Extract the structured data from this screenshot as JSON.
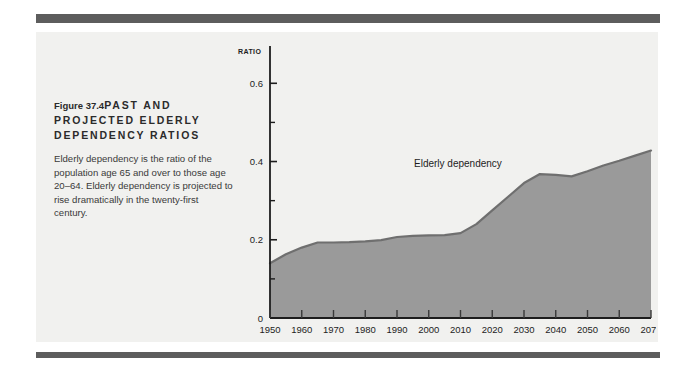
{
  "figure": {
    "number": "Figure 37.4",
    "title": "PAST AND PROJECTED ELDERLY DEPENDENCY RATIOS",
    "body": "Elderly dependency is the ratio of the population age 65 and over to those age 20–64. Elderly dependency is projected to rise dramatically in the twenty-first century."
  },
  "colors": {
    "rule": "#5d5d5d",
    "panel": "#f1f1ef",
    "area_fill": "#9a9a9a",
    "area_line": "#6f6f6f",
    "axis": "#1d1d1d",
    "text": "#2b2b2b"
  },
  "chart_data": {
    "type": "area",
    "title": "",
    "xlabel": "",
    "ylabel": "RATIO",
    "axis_unit_label": "RATIO",
    "xlim": [
      1950,
      2070
    ],
    "ylim": [
      0,
      0.68
    ],
    "yticks": [
      0,
      0.2,
      0.4,
      0.6
    ],
    "ytick_labels": [
      "0",
      "0.2",
      "0.4",
      "0.6"
    ],
    "yminor_ticks": [
      0.1,
      0.3,
      0.5
    ],
    "xticks": [
      1950,
      1960,
      1970,
      1980,
      1990,
      2000,
      2010,
      2020,
      2030,
      2040,
      2050,
      2060,
      2070
    ],
    "xtick_labels": [
      "1950",
      "1960",
      "1970",
      "1980",
      "1990",
      "2000",
      "2010",
      "2020",
      "2030",
      "2040",
      "2050",
      "2060",
      "2070"
    ],
    "grid": false,
    "legend_position": "inline-annotation",
    "series": [
      {
        "name": "Elderly dependency",
        "x": [
          1950,
          1955,
          1960,
          1965,
          1970,
          1975,
          1980,
          1985,
          1990,
          1995,
          2000,
          2005,
          2010,
          2015,
          2020,
          2025,
          2030,
          2035,
          2040,
          2045,
          2050,
          2055,
          2060,
          2065,
          2070
        ],
        "values": [
          0.14,
          0.163,
          0.18,
          0.193,
          0.193,
          0.194,
          0.196,
          0.199,
          0.207,
          0.21,
          0.211,
          0.212,
          0.217,
          0.24,
          0.275,
          0.31,
          0.345,
          0.368,
          0.366,
          0.362,
          0.375,
          0.39,
          0.402,
          0.415,
          0.428
        ]
      }
    ],
    "annotations": [
      {
        "text": "Elderly dependency",
        "x": 2010,
        "y": 0.44
      }
    ]
  }
}
